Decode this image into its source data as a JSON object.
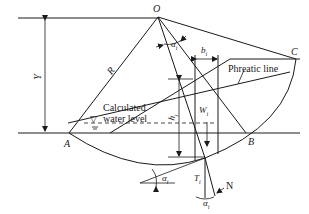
{
  "diagram": {
    "type": "slope stability slice method (circular slip surface)",
    "labels": {
      "center": "O",
      "point_a": "A",
      "point_b": "B",
      "point_c": "C",
      "radius": "R",
      "height": "Y",
      "slice_width": "b",
      "slice_width_sub": "i",
      "angle": "α",
      "angle_sub": "i",
      "weight": "W",
      "weight_sub": "i",
      "slice_height": "h",
      "slice_height_sub": "i",
      "shear": "T",
      "shear_sub": "i",
      "normal": "N",
      "phreatic_line": "Phreatic line",
      "water_level_line1": "Calculated",
      "water_level_line2": "water level",
      "water_symbol": "▽"
    }
  }
}
